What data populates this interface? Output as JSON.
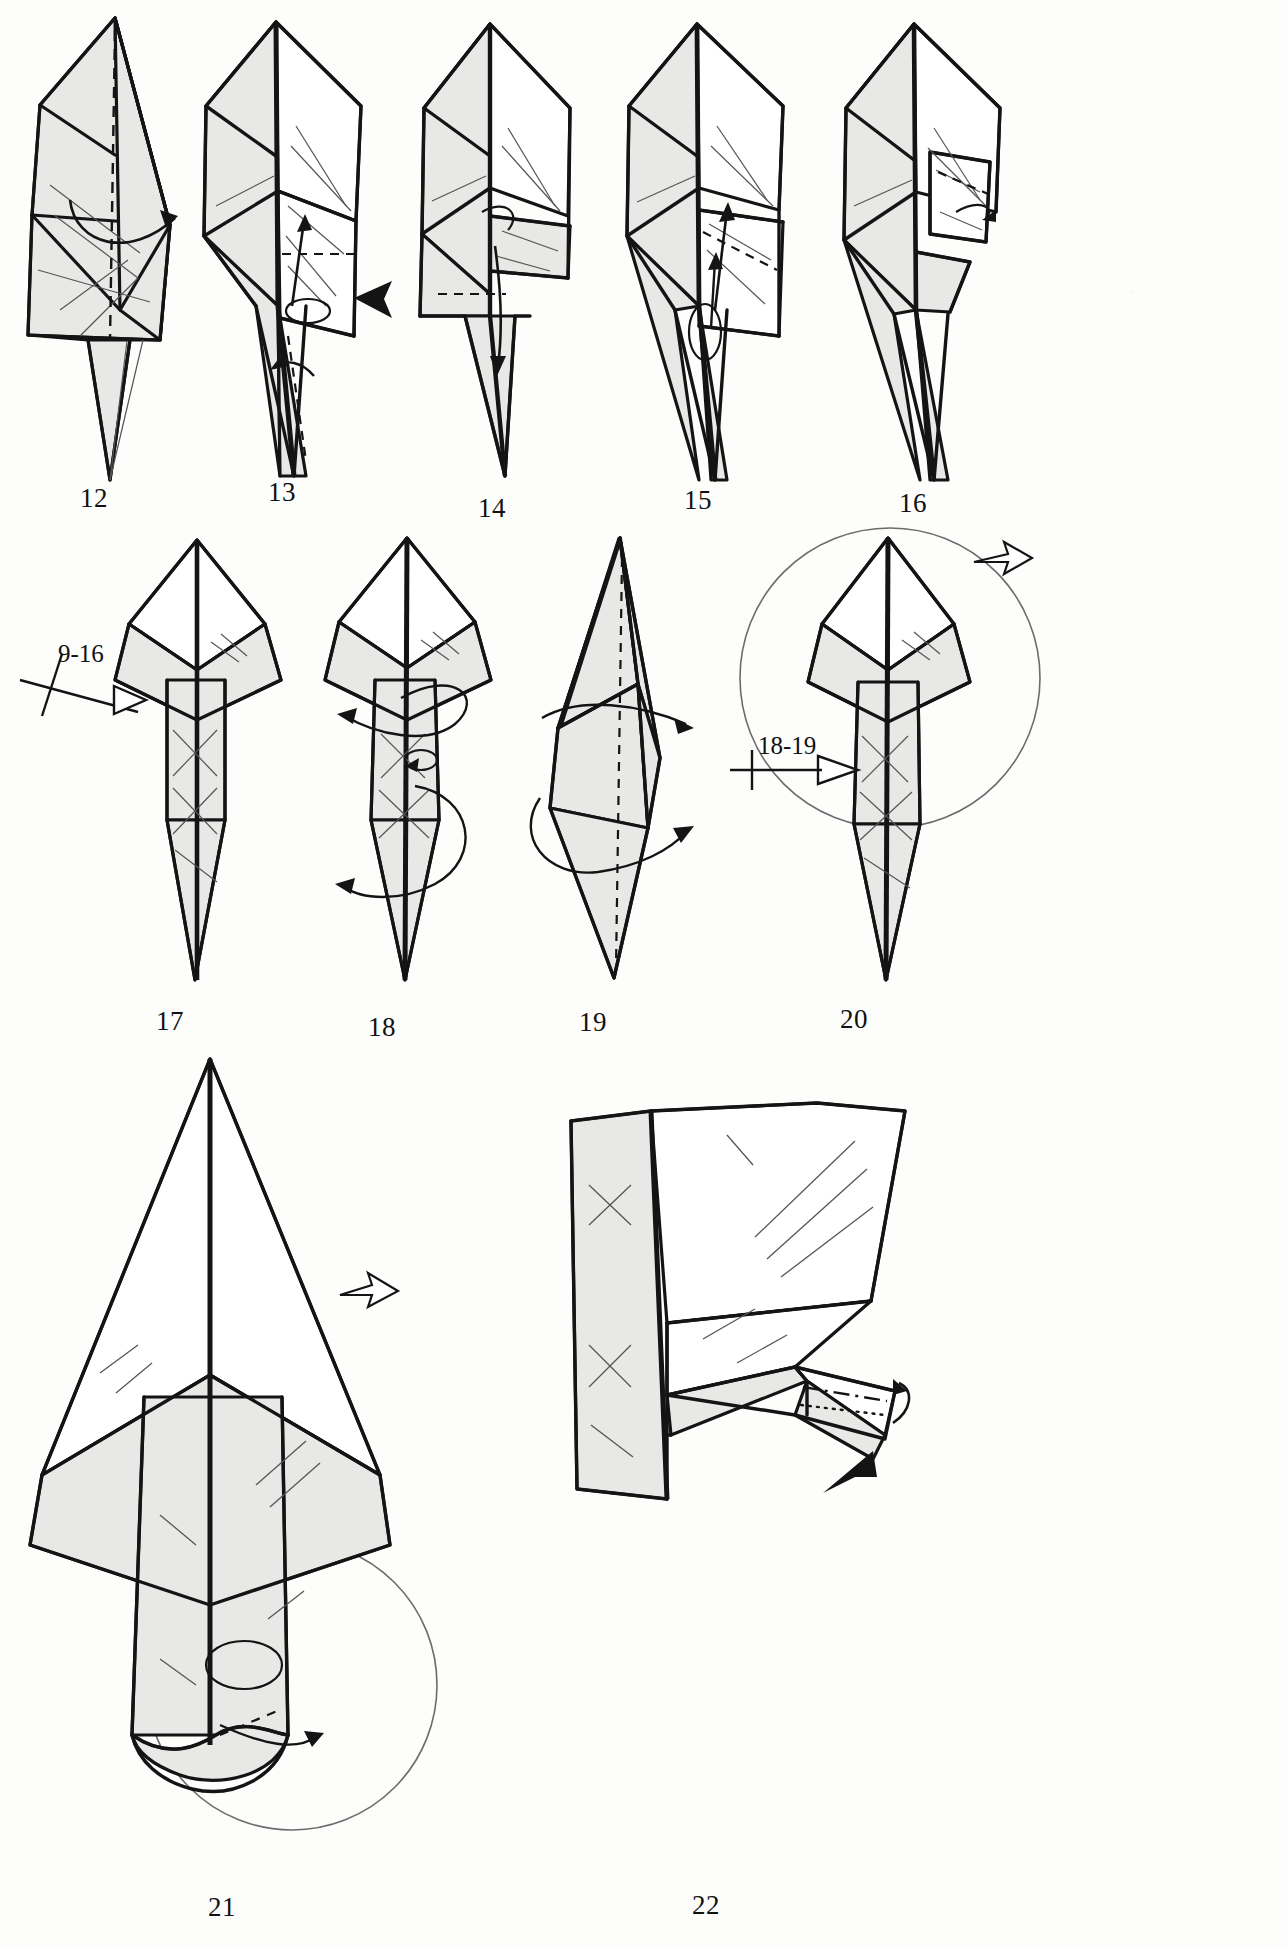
{
  "page": {
    "kind": "origami-instruction-diagram-page",
    "background_color": "#fdfdfc",
    "ink_color": "#141414",
    "paper_fill_color": "#e8e8e6",
    "paper_white_color": "#ffffff",
    "width": 1287,
    "height": 1948
  },
  "rows": [
    {
      "name": "row-1",
      "steps": [
        "12",
        "13",
        "14",
        "15",
        "16"
      ]
    },
    {
      "name": "row-2",
      "steps": [
        "17",
        "18",
        "19",
        "20"
      ]
    },
    {
      "name": "row-3",
      "steps": [
        "21",
        "22"
      ]
    }
  ],
  "steps": [
    {
      "number": "12",
      "label": "12",
      "x": 92,
      "y": 498,
      "symbols": [
        "valley-fold-dashed-line",
        "curved-fold-arrow-right"
      ]
    },
    {
      "number": "13",
      "label": "13",
      "x": 280,
      "y": 492,
      "symbols": [
        "valley-fold-dashed-line",
        "push-here-solid-arrow",
        "rotate-loop-arrow",
        "up-arrow"
      ]
    },
    {
      "number": "14",
      "label": "14",
      "x": 491,
      "y": 508,
      "symbols": [
        "valley-fold-dashed-line",
        "fold-down-arrow",
        "small-loop-arrow"
      ]
    },
    {
      "number": "15",
      "label": "15",
      "x": 696,
      "y": 500,
      "symbols": [
        "valley-fold-dashed-line",
        "up-arrow",
        "loop-arrow"
      ]
    },
    {
      "number": "16",
      "label": "16",
      "x": 911,
      "y": 503,
      "symbols": [
        "valley-fold-dashed-line",
        "small-curl-arrow"
      ]
    },
    {
      "number": "17",
      "label": "17",
      "x": 168,
      "y": 1022,
      "symbols": [
        "repeat-marker-9-16",
        "hollow-arrow-pointer"
      ]
    },
    {
      "number": "18",
      "label": "18",
      "x": 380,
      "y": 1028,
      "symbols": [
        "wrap-around-loop-arrow",
        "left-arrow",
        "small-loop-arrow"
      ]
    },
    {
      "number": "19",
      "label": "19",
      "x": 591,
      "y": 1023,
      "symbols": [
        "valley-fold-dashed-line",
        "wrap-around-loop-arrow-right"
      ]
    },
    {
      "number": "20",
      "label": "20",
      "x": 852,
      "y": 1020,
      "symbols": [
        "repeat-marker-18-19",
        "hollow-arrow-pointer",
        "zoom-circle",
        "hollow-open-arrow"
      ]
    },
    {
      "number": "21",
      "label": "21",
      "x": 222,
      "y": 1910,
      "symbols": [
        "zoom-circle",
        "hollow-open-arrow",
        "valley-fold-dashed-line",
        "curved-arrow"
      ]
    },
    {
      "number": "22",
      "label": "22",
      "x": 706,
      "y": 1908,
      "symbols": [
        "dash-dot-fold-line",
        "dotted-hidden-line",
        "push-here-solid-arrow",
        "curved-arrow"
      ]
    }
  ],
  "annotations": [
    {
      "name": "repeat-9-16",
      "text": "9-16",
      "x": 60,
      "y": 640,
      "marker": "hatched-repeat-tick",
      "pointer": "hollow-arrow"
    },
    {
      "name": "repeat-18-19",
      "text": "18-19",
      "x": 758,
      "y": 732,
      "marker": "single-tick",
      "pointer": "hollow-arrow"
    }
  ]
}
